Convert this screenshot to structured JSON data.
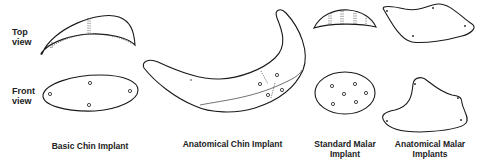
{
  "figure": {
    "row_labels": {
      "top": [
        "Top",
        "view"
      ],
      "front": [
        "Front",
        "view"
      ]
    },
    "implants": [
      {
        "id": "basic-chin",
        "caption": [
          "Basic Chin Implant"
        ]
      },
      {
        "id": "anatomical-chin",
        "caption": [
          "Anatomical Chin Implant"
        ]
      },
      {
        "id": "standard-malar",
        "caption": [
          "Standard Malar",
          "Implant"
        ]
      },
      {
        "id": "anatomical-malar",
        "caption": [
          "Anatomical Malar",
          "Implants"
        ]
      }
    ]
  }
}
